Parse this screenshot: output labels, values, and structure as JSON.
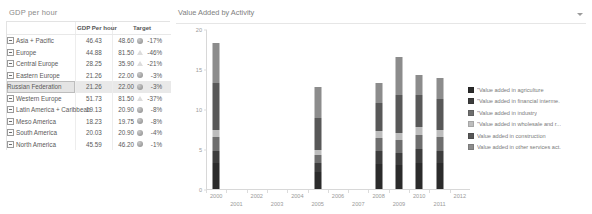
{
  "left_panel": {
    "title": "GDP per hour",
    "columns": [
      "",
      "GDP Per hour",
      "Target"
    ],
    "rows": [
      {
        "name": "Asia + Pacific",
        "indent": 0,
        "expandable": true,
        "value": "46.43",
        "target": "48.60",
        "pct": "-17%",
        "kpi": "circle",
        "selected": false
      },
      {
        "name": "Europe",
        "indent": 0,
        "expandable": true,
        "value": "44.88",
        "target": "81.50",
        "pct": "-46%",
        "kpi": "triangle",
        "selected": false
      },
      {
        "name": "Central Europe",
        "indent": 1,
        "expandable": true,
        "value": "28.25",
        "target": "35.90",
        "pct": "-21%",
        "kpi": "triangle",
        "selected": false
      },
      {
        "name": "Eastern Europe",
        "indent": 1,
        "expandable": true,
        "value": "21.26",
        "target": "22.00",
        "pct": "-3%",
        "kpi": "circle",
        "selected": false
      },
      {
        "name": "Russian Federation",
        "indent": 2,
        "expandable": false,
        "value": "21.26",
        "target": "22.00",
        "pct": "-3%",
        "kpi": "circle",
        "selected": true
      },
      {
        "name": "Western Europe",
        "indent": 1,
        "expandable": true,
        "value": "51.73",
        "target": "81.50",
        "pct": "-37%",
        "kpi": "triangle",
        "selected": false
      },
      {
        "name": "Latin America + Caribbean",
        "indent": 0,
        "expandable": true,
        "value": "19.13",
        "target": "20.90",
        "pct": "-8%",
        "kpi": "circle",
        "selected": false
      },
      {
        "name": "Meso America",
        "indent": 1,
        "expandable": true,
        "value": "18.23",
        "target": "19.75",
        "pct": "-8%",
        "kpi": "circle",
        "selected": false
      },
      {
        "name": "South America",
        "indent": 1,
        "expandable": true,
        "value": "20.03",
        "target": "20.90",
        "pct": "-4%",
        "kpi": "circle",
        "selected": false
      },
      {
        "name": "North America",
        "indent": 0,
        "expandable": true,
        "value": "45.59",
        "target": "46.20",
        "pct": "-1%",
        "kpi": "circle",
        "selected": false
      }
    ]
  },
  "right_panel": {
    "title": "Value Added by Activity",
    "menu_icon": "chevron-down-icon"
  },
  "chart_data": {
    "type": "bar",
    "stacked": true,
    "title": "Value Added by Activity",
    "xlabel": "",
    "ylabel": "",
    "ylim": [
      0,
      20
    ],
    "yticks": [
      0,
      5,
      10,
      15,
      20
    ],
    "grid": false,
    "legend_position": "right",
    "categories": [
      "2000",
      "2001",
      "2002",
      "2003",
      "2004",
      "2005",
      "2006",
      "2007",
      "2008",
      "2009",
      "2010",
      "2011",
      "2012"
    ],
    "series": [
      {
        "name": "\"Value added in agriculture",
        "color": "#2b2b2b",
        "values": [
          3.2,
          0,
          0,
          0,
          0,
          2.1,
          0,
          0,
          3.1,
          3.0,
          3.3,
          3.2,
          0
        ]
      },
      {
        "name": "\"Value added in financial  interme.",
        "color": "#3d3d3d",
        "values": [
          1.6,
          0,
          0,
          0,
          0,
          1.1,
          0,
          0,
          1.6,
          1.5,
          1.7,
          1.6,
          0
        ]
      },
      {
        "name": "\"Value added in industry",
        "color": "#6e6e6e",
        "values": [
          1.7,
          0,
          0,
          0,
          0,
          1.1,
          0,
          0,
          1.7,
          1.6,
          1.8,
          1.7,
          0
        ]
      },
      {
        "name": "\"Value added in wholesale and r...",
        "color": "#bdbdbd",
        "values": [
          0.9,
          0,
          0,
          0,
          0,
          0.6,
          0,
          0,
          0.9,
          0.9,
          0.9,
          0.9,
          0
        ]
      },
      {
        "name": "Value added in construction",
        "color": "#585858",
        "values": [
          5.8,
          0,
          0,
          0,
          0,
          4.0,
          0,
          0,
          3.4,
          4.7,
          4.0,
          3.9,
          0
        ]
      },
      {
        "name": "Value added in other services act.",
        "color": "#8c8c8c",
        "values": [
          5.1,
          0,
          0,
          0,
          0,
          3.8,
          0,
          0,
          2.6,
          4.8,
          2.6,
          2.6,
          0
        ]
      }
    ],
    "bar_totals": {
      "2000": 18.3,
      "2005": 12.7,
      "2008": 13.3,
      "2009": 15.6,
      "2010": 14.3,
      "2011": 13.9
    }
  }
}
